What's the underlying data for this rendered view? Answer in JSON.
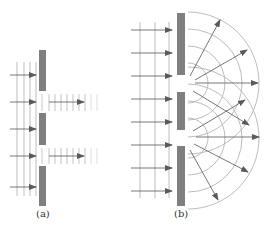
{
  "panels": [
    {
      "id": "a",
      "label": "(a)",
      "description": "Plane waves incident on barrier with two slits; transmitted as narrow plane beams (no diffraction)"
    },
    {
      "id": "b",
      "label": "(b)",
      "description": "Plane waves incident on barrier with two narrow slits; transmitted as circular diffracted waves that overlap"
    }
  ],
  "colors": {
    "barrier": "#7f7f7f",
    "wavefront": "#c8c8c8",
    "ray": "#555555",
    "arrowhead": "#5a5a5a",
    "arc": "#bdbdbd"
  },
  "diagram_a": {
    "barriers": [
      {
        "x": 39,
        "y": 50,
        "w": 7,
        "h": 41
      },
      {
        "x": 39,
        "y": 113,
        "w": 7,
        "h": 32
      },
      {
        "x": 39,
        "y": 166,
        "w": 7,
        "h": 40
      }
    ],
    "incident_wavefront_x": [
      17,
      24,
      30,
      36
    ],
    "incident_wavefront_y": [
      62,
      196
    ],
    "incident_rays_y": [
      75,
      102,
      129,
      156,
      187
    ],
    "incident_ray_x": [
      10,
      36
    ],
    "slits": [
      {
        "y_top": 94,
        "y_bottom": 111,
        "ray_y": 102
      },
      {
        "y_top": 148,
        "y_bottom": 164,
        "ray_y": 156
      }
    ],
    "transmitted_wavefront_x": [
      49,
      55,
      61,
      67,
      73,
      79,
      85,
      91,
      97
    ],
    "transmitted_ray_x": [
      49,
      84
    ]
  },
  "diagram_b": {
    "barriers": [
      {
        "x": 177,
        "y": 13,
        "w": 8,
        "h": 62
      },
      {
        "x": 177,
        "y": 92,
        "w": 8,
        "h": 38
      },
      {
        "x": 177,
        "y": 146,
        "w": 8,
        "h": 60
      }
    ],
    "incident_wavefront_x": [
      140,
      155,
      169
    ],
    "incident_wavefront_y": [
      22,
      198
    ],
    "incident_rays_y": [
      30,
      53,
      76,
      99,
      122,
      145,
      168,
      191
    ],
    "incident_ray_x": [
      131,
      172
    ],
    "slits": [
      {
        "cx": 188,
        "cy": 83
      },
      {
        "cx": 188,
        "cy": 138
      }
    ],
    "arc_radii": [
      20,
      37,
      54,
      71
    ],
    "rays": [
      {
        "from": [
          190,
          76
        ],
        "to": [
          220,
          20
        ]
      },
      {
        "from": [
          195,
          80
        ],
        "to": [
          247,
          50
        ]
      },
      {
        "from": [
          195,
          83
        ],
        "to": [
          258,
          83
        ]
      },
      {
        "from": [
          193,
          91
        ],
        "to": [
          249,
          125
        ]
      },
      {
        "from": [
          193,
          131
        ],
        "to": [
          245,
          100
        ]
      },
      {
        "from": [
          196,
          137
        ],
        "to": [
          259,
          137
        ]
      },
      {
        "from": [
          194,
          144
        ],
        "to": [
          248,
          172
        ]
      },
      {
        "from": [
          190,
          150
        ],
        "to": [
          218,
          200
        ]
      }
    ]
  }
}
